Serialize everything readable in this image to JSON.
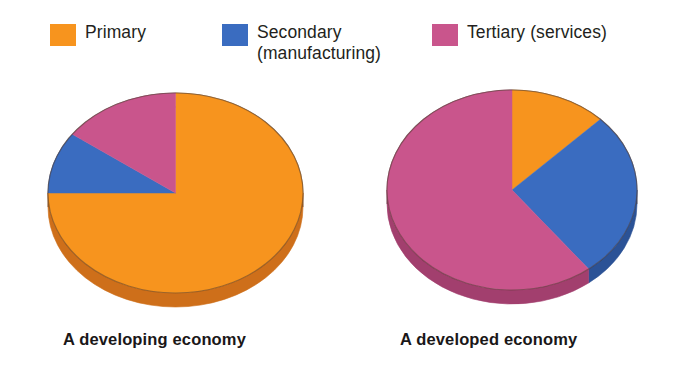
{
  "legend": {
    "items": [
      {
        "label": "Primary",
        "color": "#F7941E",
        "name": "legend-primary"
      },
      {
        "label": "Secondary\n(manufacturing)",
        "color": "#3A6CC0",
        "name": "legend-secondary"
      },
      {
        "label": "Tertiary (services)",
        "color": "#C9558C",
        "name": "legend-tertiary"
      }
    ]
  },
  "captions": {
    "left": "A developing economy",
    "right": "A developed economy"
  },
  "colors": {
    "primary": "#F7941E",
    "primary_dark": "#CE6F1A",
    "secondary": "#3A6CC0",
    "secondary_dark": "#2B5296",
    "tertiary": "#C9558C",
    "tertiary_dark": "#A23F6E",
    "outline": "#4A3328",
    "text": "#231f20"
  },
  "chart_data": [
    {
      "type": "pie",
      "title": "A developing economy",
      "labels": [
        "Primary",
        "Secondary (manufacturing)",
        "Tertiary (services)"
      ],
      "values": [
        75,
        10,
        15
      ],
      "unit": "percent",
      "start_angle_deg": 0,
      "direction": "clockwise",
      "style": "3d",
      "legend_position": "top"
    },
    {
      "type": "pie",
      "title": "A developed economy",
      "labels": [
        "Primary",
        "Secondary (manufacturing)",
        "Tertiary (services)"
      ],
      "values": [
        12.5,
        27,
        60.5
      ],
      "unit": "percent",
      "start_angle_deg": 0,
      "direction": "clockwise",
      "style": "3d",
      "legend_position": "top"
    }
  ]
}
